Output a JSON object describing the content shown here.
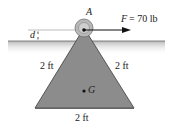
{
  "diagram": {
    "point_label": "A",
    "force_label": "F = 70 lb",
    "force_symbol": "F",
    "force_value": "= 70 lb",
    "distance_label": "d",
    "left_side_label": "2 ft",
    "right_side_label": "2 ft",
    "base_label": "2 ft",
    "centroid_label": "G",
    "colors": {
      "triangle_fill": "#8a8a8a",
      "triangle_edge": "#555555",
      "ground": "#c8c8c8",
      "pulley": "#b5b5b5",
      "arrow": "#111111"
    }
  }
}
